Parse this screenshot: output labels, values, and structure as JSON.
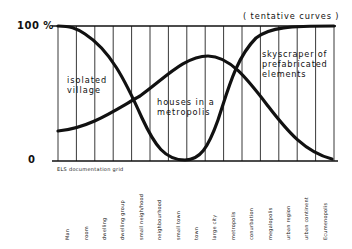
{
  "chart_data": {
    "type": "line",
    "title": "",
    "subtitle": "(tentative curves)",
    "xlabel": "",
    "ylabel": "",
    "ylim": [
      0,
      100
    ],
    "y_tick_labels": [
      "0",
      "100 %"
    ],
    "grid": true,
    "grid_caption": "ELS documentation grid",
    "categories": [
      "Man",
      "room",
      "dwelling",
      "dwelling group",
      "small neigh/hood",
      "neighbourhood",
      "small town",
      "town",
      "large city",
      "metropolis",
      "conurbation",
      "megalopolis",
      "urban region",
      "urban continent",
      "Ecumenopolis"
    ],
    "series": [
      {
        "name": "isolated village",
        "values": [
          99,
          96,
          88,
          72,
          48,
          24,
          6,
          1,
          null,
          null,
          null,
          null,
          null,
          null,
          null
        ]
      },
      {
        "name": "houses in a metropolis",
        "values": [
          23,
          26,
          31,
          38,
          47,
          56,
          63,
          69,
          70,
          62,
          45,
          26,
          11,
          3,
          0
        ]
      },
      {
        "name": "skyscraper of prefabricated elements",
        "values": [
          null,
          null,
          null,
          null,
          null,
          null,
          null,
          1,
          12,
          44,
          80,
          95,
          99,
          100,
          100
        ]
      }
    ],
    "annotations": [
      "isolated village",
      "houses in a metropolis",
      "skyscraper of prefabricated elements",
      "(tentative curves)"
    ]
  },
  "labels": {
    "y_top": "100 %",
    "y_bottom": "0",
    "tentative": "( tentative  curves )",
    "village_line1": "isolated",
    "village_line2": "village",
    "metro_line1": "houses in a",
    "metro_line2": "metropolis",
    "sky_line1": "skyscraper of",
    "sky_line2": "prefabricated",
    "sky_line3": "elements",
    "grid_caption": "ELS documentation grid"
  },
  "categories": [
    "Man",
    "room",
    "dwelling",
    "dwelling group",
    "small neigh/hood",
    "neighbourhood",
    "small town",
    "town",
    "large city",
    "metropolis",
    "conurbation",
    "megalopolis",
    "urban region",
    "urban continent",
    "Ecumenopolis"
  ],
  "colors": {
    "ink": "#111111",
    "background": "#ffffff"
  }
}
